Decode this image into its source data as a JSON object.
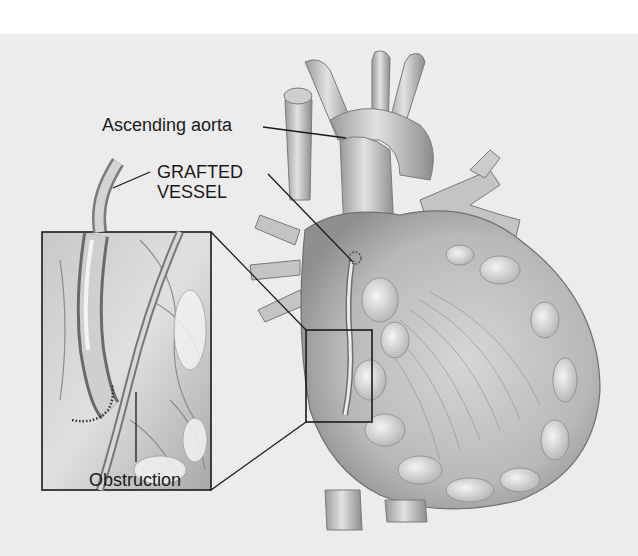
{
  "figure": {
    "style": "grayscale anatomical illustration",
    "colors": {
      "background": "#ececec",
      "page": "#ffffff",
      "line": "#1a1a1a",
      "tissue_light": "#d9d9d9",
      "tissue_mid": "#b5b5b5",
      "tissue_dark": "#8a8a8a"
    }
  },
  "labels": {
    "ascending_aorta": "Ascending aorta",
    "grafted_vessel_line1": "GRAFTED",
    "grafted_vessel_line2": "VESSEL",
    "obstruction": "Obstruction"
  },
  "callouts": {
    "inset": "Magnified view of grafted vessel bypassing obstruction",
    "source_box": "Region on heart shown in magnified inset"
  }
}
